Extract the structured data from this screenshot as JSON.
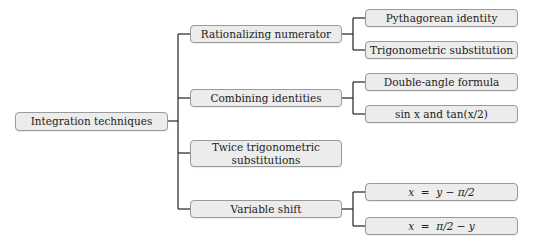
{
  "diagram": {
    "type": "tree",
    "root": {
      "label": "Integration techniques"
    },
    "children": [
      {
        "label": "Rationalizing numerator",
        "children": [
          {
            "label": "Pythagorean identity"
          },
          {
            "label": "Trigonometric substitution"
          }
        ]
      },
      {
        "label": "Combining identities",
        "children": [
          {
            "label": "Double-angle formula"
          },
          {
            "label": "sin x and tan(x/2)"
          }
        ]
      },
      {
        "label": "Twice trigonometric substitutions",
        "children": []
      },
      {
        "label": "Variable shift",
        "children": [
          {
            "label": "x  =  y − π/2"
          },
          {
            "label": "x  =  π/2 − y"
          }
        ]
      }
    ]
  },
  "colors": {
    "node_fill": "#ececec",
    "node_border": "#9a9a9a",
    "edge": "#222222",
    "text": "#222222"
  }
}
